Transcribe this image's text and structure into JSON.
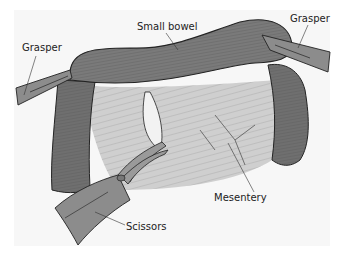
{
  "figure": {
    "labels": {
      "grasper_left": "Grasper",
      "small_bowel": "Small bowel",
      "grasper_right": "Grasper",
      "mesentery": "Mesentery",
      "scissors": "Scissors"
    },
    "colors": {
      "background": "#f7f7f7",
      "bowel": "#7a7a7a",
      "bowel_dark": "#555555",
      "mesentery": "#c9c9c9",
      "instrument": "#8c8c8c",
      "line": "#222222"
    }
  }
}
